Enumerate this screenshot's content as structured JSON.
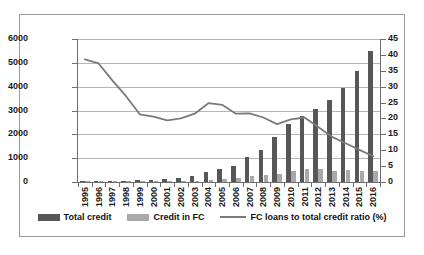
{
  "chart_data": {
    "type": "bar",
    "title": "",
    "subtitle": "",
    "xlabel": "",
    "ylabel": "",
    "y2label": "",
    "grid": true,
    "legend_position": "bottom",
    "ylim": [
      0,
      6000
    ],
    "y2lim": [
      0,
      45
    ],
    "yticks": [
      "0",
      "1000",
      "2000",
      "3000",
      "4000",
      "5000",
      "6000"
    ],
    "y2ticks": [
      "0",
      "5",
      "10",
      "15",
      "20",
      "25",
      "30",
      "35",
      "40",
      "45"
    ],
    "categories": [
      "1995",
      "1996",
      "1997",
      "1998",
      "1999",
      "2000",
      "2001",
      "2002",
      "2003",
      "2004",
      "2005",
      "2006",
      "2007",
      "2008",
      "2009",
      "2010",
      "2011",
      "2012",
      "2013",
      "2014",
      "2015",
      "2016"
    ],
    "series": [
      {
        "name": "Total credit",
        "type": "bar",
        "axis": "left",
        "color": "#575757",
        "values": [
          5,
          8,
          12,
          18,
          65,
          95,
          110,
          150,
          270,
          430,
          530,
          690,
          1060,
          1340,
          1870,
          2450,
          2790,
          3050,
          3440,
          3950,
          4650,
          5500
        ]
      },
      {
        "name": "Credit in FC",
        "type": "bar",
        "axis": "left",
        "color": "#a9a9a9",
        "values": [
          2,
          3,
          4,
          6,
          15,
          20,
          22,
          30,
          60,
          95,
          115,
          155,
          240,
          285,
          355,
          480,
          555,
          530,
          470,
          500,
          480,
          450
        ]
      },
      {
        "name": "FC loans to total credit ratio (%)",
        "type": "line",
        "axis": "right",
        "color": "#7a7a7a",
        "values": [
          38.6,
          37.3,
          32.0,
          27.0,
          21.3,
          20.6,
          19.4,
          20.0,
          21.5,
          24.8,
          24.3,
          21.5,
          21.6,
          20.3,
          18.2,
          19.7,
          20.3,
          17.3,
          14.2,
          12.2,
          10.1,
          8.1
        ]
      }
    ]
  },
  "legend": {
    "items": [
      {
        "label": "Total credit"
      },
      {
        "label": "Credit in FC"
      },
      {
        "label": "FC loans to total credit ratio (%)"
      }
    ]
  }
}
